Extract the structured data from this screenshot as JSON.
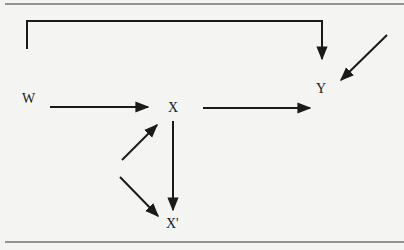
{
  "diagram": {
    "type": "path-diagram",
    "nodes": [
      {
        "id": "W",
        "label": "W"
      },
      {
        "id": "X",
        "label": "X"
      },
      {
        "id": "Y",
        "label": "Y"
      },
      {
        "id": "Xp",
        "label": "X'"
      }
    ],
    "edges": [
      {
        "from": "W",
        "to": "Y",
        "style": "bracket-over-top"
      },
      {
        "from": "W",
        "to": "X"
      },
      {
        "from": "X",
        "to": "Y"
      },
      {
        "from": "external",
        "to": "Y",
        "note": "disturbance arrow from upper right"
      },
      {
        "from": "X",
        "to": "Xp"
      },
      {
        "from": "external",
        "to": "X",
        "note": "disturbance arrow from lower left"
      },
      {
        "from": "external",
        "to": "Xp",
        "note": "disturbance arrow from left"
      }
    ]
  },
  "colors": {
    "ink": "#1a1a1a",
    "paper": "#f4f4f2"
  }
}
